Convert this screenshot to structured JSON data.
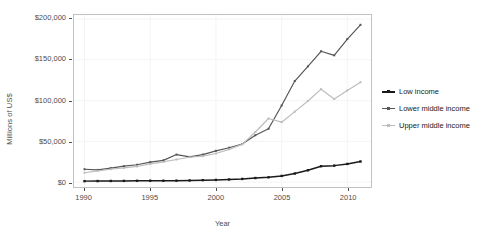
{
  "chart_data": {
    "type": "line",
    "title": "",
    "xlabel": "Year",
    "ylabel": "Millions of US$",
    "xlim": [
      1989.2,
      2011.8
    ],
    "ylim": [
      -6000,
      205000
    ],
    "grid": true,
    "legend_position": "right",
    "x": [
      1990,
      1991,
      1992,
      1993,
      1994,
      1995,
      1996,
      1997,
      1998,
      1999,
      2000,
      2001,
      2002,
      2003,
      2004,
      2005,
      2006,
      2007,
      2008,
      2009,
      2010,
      2011
    ],
    "xticks": [
      1990,
      1995,
      2000,
      2005,
      2010
    ],
    "xticklabels": [
      "1990",
      "1995",
      "2000",
      "2005",
      "2010"
    ],
    "yticks": [
      0,
      50000,
      100000,
      150000,
      200000
    ],
    "yticklabels": [
      "$0",
      "$50,000",
      "$100,000",
      "$150,000",
      "$200,000"
    ],
    "series": [
      {
        "name": "Low income",
        "color": "#1a1a1a",
        "values": [
          1200,
          1300,
          1400,
          1500,
          1600,
          1700,
          1700,
          1800,
          2000,
          2400,
          2700,
          3200,
          3900,
          5000,
          5900,
          7600,
          10500,
          14500,
          19500,
          20200,
          22300,
          25300
        ]
      },
      {
        "name": "Lower middle income",
        "color": "#565656",
        "values": [
          15800,
          15000,
          17200,
          19500,
          21300,
          24500,
          26700,
          33800,
          31000,
          33800,
          38400,
          42200,
          46800,
          57500,
          65500,
          94000,
          124000,
          142000,
          160500,
          155500,
          175500,
          193000
        ]
      },
      {
        "name": "Upper middle income",
        "color": "#bdbdbd",
        "values": [
          11500,
          13800,
          15800,
          17400,
          19200,
          22300,
          24800,
          27700,
          30500,
          31800,
          35100,
          40200,
          46300,
          61500,
          78000,
          73500,
          86500,
          99500,
          114000,
          102000,
          112500,
          122500
        ]
      }
    ]
  },
  "legend": {
    "items": [
      {
        "label": "Low income"
      },
      {
        "label": "Lower middle income"
      },
      {
        "label": "Upper middle income"
      }
    ]
  }
}
